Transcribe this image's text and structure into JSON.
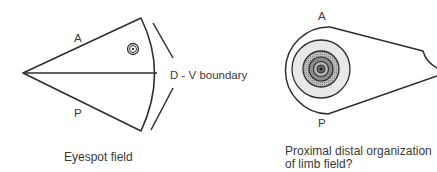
{
  "left_figure": {
    "label_anterior": "A",
    "label_posterior": "P",
    "boundary_label": "D - V boundary",
    "caption": "Eyespot field"
  },
  "right_figure": {
    "label_anterior": "A",
    "label_posterior": "P",
    "caption_line1": "Proximal distal organization",
    "caption_line2": "of limb field?"
  },
  "colors": {
    "stroke": "#2e2e2e",
    "ring_light": "#e6e6e6",
    "ring_mid": "#a8a8a8",
    "ring_dark": "#7a7a7a",
    "ring_darker": "#5a5a5a"
  }
}
